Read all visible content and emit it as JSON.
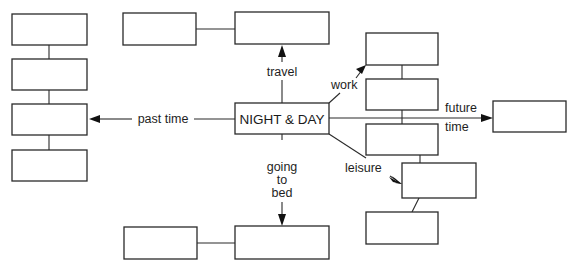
{
  "diagram": {
    "type": "mind-map",
    "center": {
      "label": "NIGHT & DAY"
    },
    "branches": [
      {
        "id": "past-time",
        "label": "past time",
        "boxes": 4,
        "box_labels": [
          "",
          "",
          "",
          ""
        ]
      },
      {
        "id": "travel",
        "label": "travel",
        "boxes": 2,
        "box_labels": [
          "",
          ""
        ]
      },
      {
        "id": "going-to-bed",
        "label_lines": [
          "going",
          "to",
          "bed"
        ],
        "boxes": 2,
        "box_labels": [
          "",
          ""
        ]
      },
      {
        "id": "work",
        "label": "work",
        "boxes": 3,
        "box_labels": [
          "",
          "",
          ""
        ]
      },
      {
        "id": "future-time",
        "label_lines": [
          "future",
          "time"
        ],
        "boxes": 1,
        "box_labels": [
          ""
        ]
      },
      {
        "id": "leisure",
        "label": "leisure",
        "boxes": 2,
        "box_labels": [
          "",
          ""
        ]
      }
    ]
  }
}
